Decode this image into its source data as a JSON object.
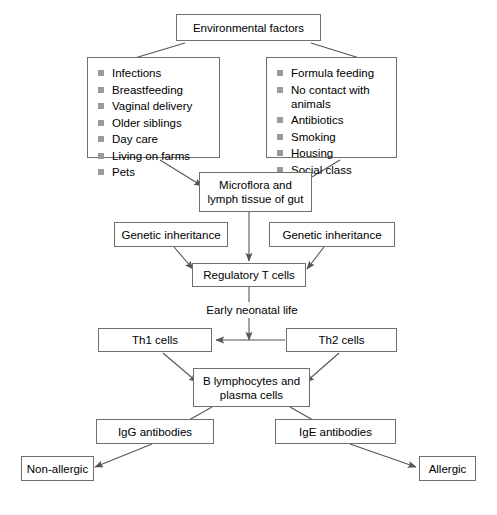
{
  "diagram": {
    "line_color": "#6f6f6f",
    "bullet_color": "#9a9a9a",
    "background": "#ffffff",
    "nodes": {
      "environmental_factors": "Environmental factors",
      "microflora": "Microflora and\nlymph tissue of gut",
      "genetic_inheritance_left": "Genetic inheritance",
      "genetic_inheritance_right": "Genetic inheritance",
      "regulatory_t_cells": "Regulatory T cells",
      "early_neonatal_life": "Early neonatal life",
      "th1_cells": "Th1 cells",
      "th2_cells": "Th2 cells",
      "b_lymphocytes": "B lymphocytes and\nplasma cells",
      "igg_antibodies": "IgG antibodies",
      "ige_antibodies": "IgE antibodies",
      "non_allergic": "Non-allergic",
      "allergic": "Allergic"
    },
    "protective_factors": [
      "Infections",
      "Breastfeeding",
      "Vaginal delivery",
      "Older siblings",
      "Day care",
      "Living on farms",
      "Pets"
    ],
    "risk_factors": [
      "Formula feeding",
      "No contact with\nanimals",
      "Antibiotics",
      "Smoking",
      "Housing",
      "Social class"
    ]
  }
}
